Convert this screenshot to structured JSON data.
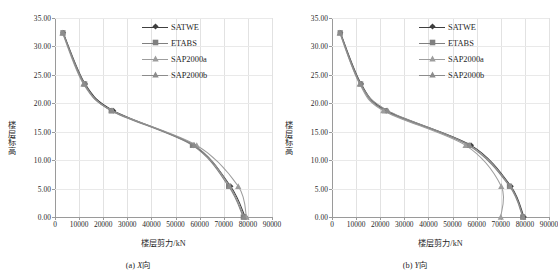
{
  "figure": {
    "panels": [
      {
        "caption_prefix": "(a)",
        "caption_italic": "X",
        "caption_suffix": "向"
      },
      {
        "caption_prefix": "(b)",
        "caption_italic": "Y",
        "caption_suffix": "向"
      }
    ]
  },
  "legend": {
    "items": [
      {
        "label": "SATWE",
        "symbol": "diamond",
        "color": "#3f3f3f"
      },
      {
        "label": "ETABS",
        "symbol": "square",
        "color": "#808080"
      },
      {
        "label": "SAP2000a",
        "symbol": "triangle",
        "color": "#9d9d9d"
      },
      {
        "label": "SAP2000b",
        "symbol": "triangle",
        "color": "#8c8c8c"
      }
    ]
  },
  "axes": {
    "x_title": "楼层剪力/kN",
    "y_title": "楼层标高",
    "x_ticks": [
      "0",
      "10000",
      "20000",
      "30000",
      "40000",
      "50000",
      "60000",
      "70000",
      "80000",
      "90000"
    ],
    "y_ticks": [
      "0.00",
      "5.00",
      "10.00",
      "15.00",
      "20.00",
      "25.00",
      "30.00",
      "35.00"
    ],
    "xlim": [
      0,
      90000
    ],
    "ylim": [
      0,
      35
    ]
  },
  "chart_data": [
    {
      "type": "line",
      "title": "(a) X向",
      "xlabel": "楼层剪力/kN",
      "ylabel": "楼层标高",
      "xlim": [
        0,
        90000
      ],
      "ylim": [
        0,
        35
      ],
      "grid": true,
      "legend_position": "top-right",
      "x_ticks": [
        0,
        10000,
        20000,
        30000,
        40000,
        50000,
        60000,
        70000,
        80000,
        90000
      ],
      "y_ticks": [
        0,
        5,
        10,
        15,
        20,
        25,
        30,
        35
      ],
      "series": [
        {
          "name": "SATWE",
          "color": "#3f3f3f",
          "marker": "diamond",
          "points": [
            [
              3400,
              32.4
            ],
            [
              12500,
              23.4
            ],
            [
              24200,
              18.7
            ],
            [
              57500,
              12.6
            ],
            [
              72800,
              5.4
            ],
            [
              78900,
              0.0
            ]
          ]
        },
        {
          "name": "ETABS",
          "color": "#808080",
          "marker": "square",
          "points": [
            [
              3300,
              32.4
            ],
            [
              12300,
              23.4
            ],
            [
              23300,
              18.7
            ],
            [
              57000,
              12.6
            ],
            [
              72000,
              5.4
            ],
            [
              78100,
              0.0
            ]
          ]
        },
        {
          "name": "SAP2000a",
          "color": "#9d9d9d",
          "marker": "triangle",
          "points": [
            [
              3100,
              32.4
            ],
            [
              11800,
              23.4
            ],
            [
              23700,
              18.7
            ],
            [
              58800,
              12.6
            ],
            [
              76000,
              5.4
            ],
            [
              79400,
              0.0
            ]
          ]
        },
        {
          "name": "SAP2000b",
          "color": "#8c8c8c",
          "marker": "triangle",
          "points": [
            [
              3200,
              32.4
            ],
            [
              12000,
              23.4
            ],
            [
              23500,
              18.7
            ],
            [
              57800,
              12.6
            ],
            [
              72400,
              5.4
            ],
            [
              78400,
              0.0
            ]
          ]
        }
      ]
    },
    {
      "type": "line",
      "title": "(b) Y向",
      "xlabel": "楼层剪力/kN",
      "ylabel": "楼层标高",
      "xlim": [
        0,
        90000
      ],
      "ylim": [
        0,
        35
      ],
      "grid": true,
      "legend_position": "top-right",
      "x_ticks": [
        0,
        10000,
        20000,
        30000,
        40000,
        50000,
        60000,
        70000,
        80000,
        90000
      ],
      "y_ticks": [
        0,
        5,
        10,
        15,
        20,
        25,
        30,
        35
      ],
      "series": [
        {
          "name": "SATWE",
          "color": "#3f3f3f",
          "marker": "diamond",
          "points": [
            [
              3500,
              32.4
            ],
            [
              12100,
              23.4
            ],
            [
              22600,
              18.7
            ],
            [
              57700,
              12.6
            ],
            [
              74200,
              5.4
            ],
            [
              79600,
              0.0
            ]
          ]
        },
        {
          "name": "ETABS",
          "color": "#808080",
          "marker": "square",
          "points": [
            [
              3400,
              32.4
            ],
            [
              11900,
              23.4
            ],
            [
              21800,
              18.7
            ],
            [
              56600,
              12.6
            ],
            [
              73600,
              5.4
            ],
            [
              79100,
              0.0
            ]
          ]
        },
        {
          "name": "SAP2000a",
          "color": "#9d9d9d",
          "marker": "triangle",
          "points": [
            [
              3200,
              32.4
            ],
            [
              11500,
              23.4
            ],
            [
              21300,
              18.7
            ],
            [
              55400,
              12.6
            ],
            [
              70200,
              5.4
            ],
            [
              70000,
              0.0
            ]
          ]
        },
        {
          "name": "SAP2000b",
          "color": "#8c8c8c",
          "marker": "triangle",
          "points": [
            [
              3300,
              32.4
            ],
            [
              11700,
              23.4
            ],
            [
              23100,
              18.7
            ],
            [
              57100,
              12.6
            ],
            [
              73900,
              5.4
            ],
            [
              79300,
              0.0
            ]
          ]
        }
      ]
    }
  ]
}
